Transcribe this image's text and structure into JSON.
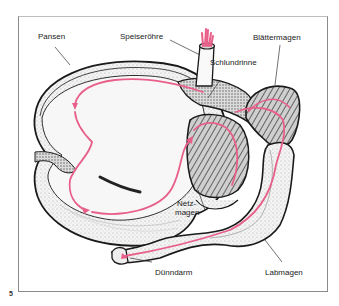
{
  "figure": {
    "number": "5",
    "labels": {
      "pansen": "Pansen",
      "speiseroehre": "Speiseröhre",
      "schlundrinne": "Schlundrinne",
      "blaettermagen": "Blättermagen",
      "netzmagen_line1": "Netz-",
      "netzmagen_line2": "magen",
      "duenndarm": "Dünndarm",
      "labmagen": "Labmagen"
    },
    "colors": {
      "food_path": "#e8608a",
      "outline": "#1a1a1a",
      "frame": "#8a8a8a"
    }
  }
}
